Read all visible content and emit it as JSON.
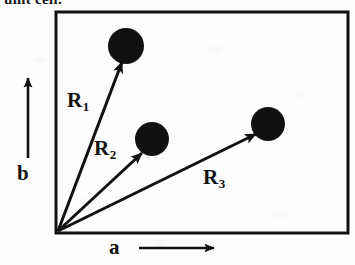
{
  "figure": {
    "clipped_caption_text": "unit cell.",
    "background_color": "#fdfdfd",
    "ink_color": "#111111"
  },
  "cell": {
    "name": "unit-cell-rectangle",
    "x": 56,
    "y": 12,
    "width": 292,
    "height": 221,
    "stroke_width": 3
  },
  "axes": [
    {
      "id": "b",
      "label": "b",
      "direction": "up",
      "label_x": 17,
      "label_y": 163,
      "shaft_x": 28,
      "shaft_top": 74,
      "shaft_bottom": 158
    },
    {
      "id": "a",
      "label": "a",
      "direction": "right",
      "label_x": 109,
      "label_y": 237,
      "shaft_y": 248,
      "shaft_left": 139,
      "shaft_right": 214
    }
  ],
  "origin": {
    "x": 58,
    "y": 231,
    "label": "cell-origin"
  },
  "vectors": [
    {
      "id": "R1",
      "label_base": "R",
      "label_sub": "1",
      "label_x": 67,
      "label_y": 90,
      "from_x": 58,
      "from_y": 231,
      "to_x": 122,
      "to_y": 62
    },
    {
      "id": "R2",
      "label_base": "R",
      "label_sub": "2",
      "label_x": 94,
      "label_y": 138,
      "from_x": 58,
      "from_y": 231,
      "to_x": 142,
      "to_y": 153
    },
    {
      "id": "R3",
      "label_base": "R",
      "label_sub": "3",
      "label_x": 203,
      "label_y": 167,
      "from_x": 58,
      "from_y": 231,
      "to_x": 256,
      "to_y": 134
    }
  ],
  "atoms": [
    {
      "id": "atom-1",
      "cx": 126,
      "cy": 46,
      "r": 18
    },
    {
      "id": "atom-2",
      "cx": 152,
      "cy": 139,
      "r": 17
    },
    {
      "id": "atom-3",
      "cx": 268,
      "cy": 124,
      "r": 17
    }
  ]
}
